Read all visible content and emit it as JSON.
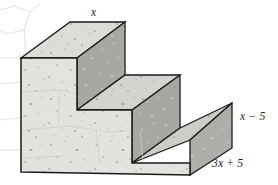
{
  "figure": {
    "type": "geometry-diagram",
    "background_color": "#ffffff",
    "outline_color": "#1a1a1a",
    "colors": {
      "tread_top": "#dedcd9",
      "tread_mid": "#d5d3d0",
      "tread_low": "#cfcdca",
      "riser": "#a9a7a4",
      "riser_dark": "#9d9b98",
      "left_face": "#e4e2df",
      "front_face": "#d9d7d4",
      "right_face": "#b0aeab",
      "outline": "#1a1a1a",
      "speckle": "#7a7876",
      "crack": "#d0cdc9"
    },
    "projection": "oblique parallel projection",
    "texture": "speckled concrete with faint hairline cracks"
  },
  "labels": {
    "top": {
      "id": "top-dimension",
      "text": "x",
      "parts": [
        {
          "kind": "var",
          "text": "x"
        }
      ],
      "describes": "depth of the top step tread",
      "position": "above top step"
    },
    "right": {
      "id": "right-dimension",
      "text": "x − 5",
      "parts": [
        {
          "kind": "var",
          "text": "x"
        },
        {
          "kind": "op",
          "text": " − 5"
        }
      ],
      "describes": "height of the lowest step on the right side",
      "position": "right of bottom step"
    },
    "bottom": {
      "id": "bottom-dimension",
      "text": "3x + 5",
      "parts": [
        {
          "kind": "num",
          "text": "3"
        },
        {
          "kind": "var",
          "text": "x"
        },
        {
          "kind": "op",
          "text": " + 5"
        }
      ],
      "describes": "width of the bottom front-right edge",
      "position": "below right face"
    }
  }
}
